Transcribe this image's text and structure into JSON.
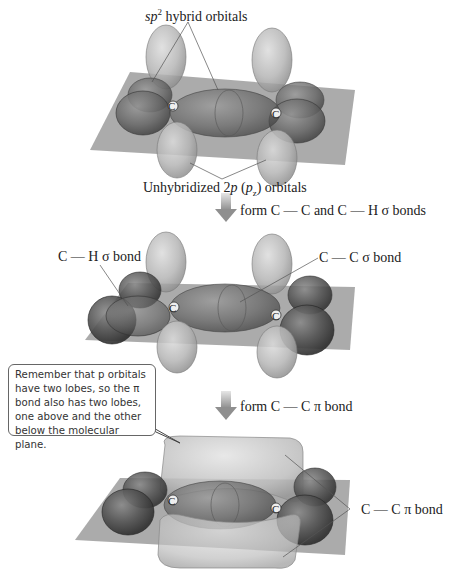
{
  "diagram": {
    "colors": {
      "plane": "#8f8f8f",
      "lobe_light": "#b9b9b9",
      "lobe_dark": "#5e5e5e",
      "h_sphere": "#4a4a4a",
      "arrow": "#9a9a9a",
      "text": "#222222"
    },
    "stage1": {
      "top_label_sp": "sp",
      "top_label_sup": "2",
      "top_label_rest": " hybrid orbitals",
      "bottom_label_prefix": "Unhybridized 2",
      "bottom_label_p": "p",
      "bottom_label_paren_open": " (",
      "bottom_label_pz": "p",
      "bottom_label_sub": "z",
      "bottom_label_suffix": ")  orbitals",
      "atom_left": "C",
      "atom_right": "C"
    },
    "step1": {
      "label": "form C — C and C — H σ bonds"
    },
    "stage2": {
      "label_ch": "C — H σ bond",
      "label_cc": "C — C σ bond",
      "atom_left": "C",
      "atom_right": "C"
    },
    "step2": {
      "label": "form C — C π bond"
    },
    "callout": {
      "text": "Remember that p orbitals have two lobes, so the π bond also has two lobes, one above and the other below the molecular plane."
    },
    "stage3": {
      "label_pi": "C — C π bond",
      "atom_left": "C",
      "atom_right": "C"
    }
  }
}
